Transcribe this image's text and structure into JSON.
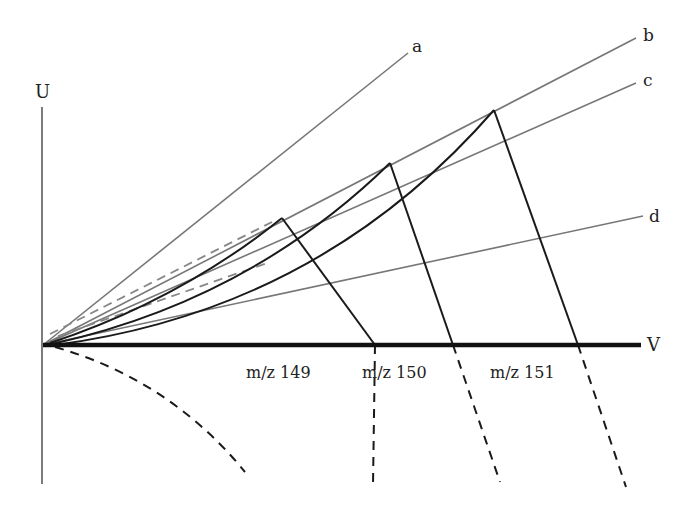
{
  "diagram": {
    "type": "mass-spectrometry-stability-diagram",
    "axes": {
      "u_label": "U",
      "v_label": "V"
    },
    "scan_lines": [
      {
        "id": "a",
        "label": "a",
        "end": [
          408,
          53
        ]
      },
      {
        "id": "b",
        "label": "b",
        "end": [
          636,
          38
        ]
      },
      {
        "id": "c",
        "label": "c",
        "end": [
          636,
          83
        ]
      },
      {
        "id": "d",
        "label": "d",
        "end": [
          643,
          216
        ]
      }
    ],
    "stability_regions": [
      {
        "label": "m/z 149",
        "apex": [
          282,
          218
        ],
        "v_intercept": [
          375,
          345
        ],
        "dash_end": [
          373,
          486
        ]
      },
      {
        "label": "m/z 150",
        "apex": [
          390,
          163
        ],
        "v_intercept": [
          453,
          345
        ],
        "dash_end": [
          500,
          482
        ]
      },
      {
        "label": "m/z 151",
        "apex": [
          494,
          110
        ],
        "v_intercept": [
          578,
          345
        ],
        "dash_end": [
          626,
          487
        ]
      }
    ],
    "colors": {
      "axis": "#111111",
      "scan_line": "#777777",
      "boundary": "#1a1a1a",
      "dashed_scan": "#888888"
    }
  }
}
